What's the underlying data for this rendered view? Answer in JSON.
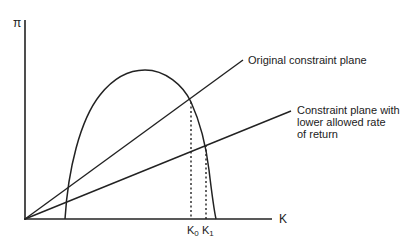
{
  "diagram": {
    "y_axis_label": "π",
    "x_axis_label": "K",
    "lines": {
      "original": "Original constraint plane",
      "lower": "Constraint plane with\nlower allowed rate\nof return"
    },
    "ticks": {
      "k0_base": "K",
      "k0_sub": "0",
      "k1_base": "K",
      "k1_sub": "1"
    },
    "colors": {
      "ink": "#222222",
      "background": "#ffffff"
    }
  }
}
